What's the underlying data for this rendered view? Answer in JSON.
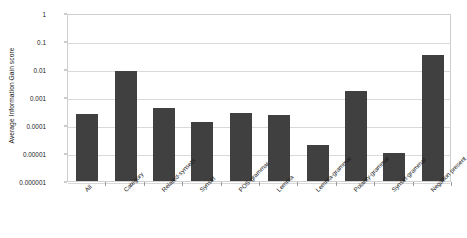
{
  "chart_data": {
    "type": "bar",
    "title": "",
    "xlabel": "",
    "ylabel": "Average Information Gain score",
    "yscale": "log",
    "ylim": [
      1e-06,
      1
    ],
    "grid": true,
    "legend": "none",
    "bar_color": "#404040",
    "ytick_labels": [
      "1",
      "0.1",
      "0.01",
      "0.001",
      "0.0001",
      "0.00001",
      "0.000001"
    ],
    "ytick_values": [
      1,
      0.1,
      0.01,
      0.001,
      0.0001,
      1e-05,
      1e-06
    ],
    "categories": [
      "All",
      "Category",
      "Related-synsets",
      "Synset",
      "POS-grammar",
      "Lemma",
      "Lemma-grammar",
      "Polarity-grammar",
      "Synset-grammar",
      "Negation present"
    ],
    "values": [
      0.00025,
      0.0085,
      0.0004,
      0.00013,
      0.00026,
      0.00022,
      2e-05,
      0.0016,
      1e-05,
      0.031
    ]
  }
}
